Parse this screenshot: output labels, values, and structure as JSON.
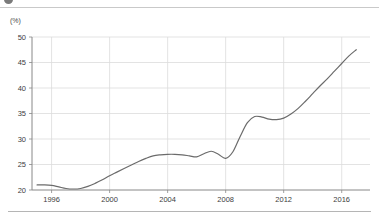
{
  "toolbar": {
    "dot_icon": "circle-icon",
    "fragments": [
      "—",
      "— —",
      "—",
      "—",
      "—"
    ]
  },
  "chart_data": {
    "type": "line",
    "title": "",
    "xlabel": "",
    "ylabel": "",
    "unit_label": "(%)",
    "grid": true,
    "legend": "none",
    "line_color": "#6b6b6b",
    "grid_color": "#dcdcdc",
    "axis_color": "#888888",
    "xlim": [
      1994.8,
      1995.0
    ],
    "ylim": [
      20,
      50
    ],
    "yticks": [
      20,
      25,
      30,
      35,
      40,
      45,
      50
    ],
    "ytick_labels": [
      "20",
      "25",
      "30",
      "35",
      "40",
      "45",
      "50"
    ],
    "xticks": [
      1996,
      2000,
      2004,
      2008,
      2012,
      2016
    ],
    "xtick_labels": [
      "1996",
      "2000",
      "2004",
      "2008",
      "2012",
      "2016"
    ],
    "x": [
      1995.0,
      1995.5,
      1996.0,
      1996.5,
      1997.0,
      1997.5,
      1998.0,
      1998.5,
      1999.0,
      1999.5,
      2000.0,
      2000.5,
      2001.0,
      2001.5,
      2002.0,
      2002.5,
      2003.0,
      2003.5,
      2004.0,
      2004.5,
      2005.0,
      2005.5,
      2006.0,
      2006.5,
      2007.0,
      2007.5,
      2008.0,
      2008.5,
      2009.0,
      2009.5,
      2010.0,
      2010.5,
      2011.0,
      2011.5,
      2012.0,
      2012.5,
      2013.0,
      2013.5,
      2014.0,
      2014.5,
      2015.0,
      2015.5,
      2016.0,
      2016.5,
      2017.0
    ],
    "values": [
      21.0,
      21.0,
      20.9,
      20.6,
      20.3,
      20.2,
      20.3,
      20.7,
      21.3,
      22.0,
      22.8,
      23.5,
      24.2,
      24.9,
      25.6,
      26.2,
      26.7,
      26.9,
      27.0,
      27.0,
      26.9,
      26.7,
      26.5,
      27.1,
      27.6,
      27.0,
      26.2,
      27.5,
      30.5,
      33.2,
      34.4,
      34.3,
      33.9,
      33.8,
      34.1,
      34.9,
      36.0,
      37.4,
      38.9,
      40.4,
      41.8,
      43.3,
      44.8,
      46.3,
      47.5
    ],
    "series_name": ""
  }
}
